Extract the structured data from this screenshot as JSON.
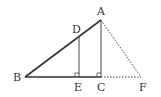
{
  "diagram": {
    "points": {
      "A": {
        "label": "A",
        "x": 101,
        "y": 20,
        "lx": 97,
        "ly": 15
      },
      "B": {
        "label": "B",
        "x": 25,
        "y": 77,
        "lx": 13,
        "ly": 81
      },
      "C": {
        "label": "C",
        "x": 101,
        "y": 77,
        "lx": 97,
        "ly": 91
      },
      "D": {
        "label": "D",
        "x": 79,
        "y": 37,
        "lx": 72,
        "ly": 33
      },
      "E": {
        "label": "E",
        "x": 79,
        "y": 77,
        "lx": 74,
        "ly": 91
      },
      "F": {
        "label": "F",
        "x": 141,
        "y": 77,
        "lx": 139,
        "ly": 91
      }
    },
    "solid_segments": [
      "AB",
      "BC",
      "AC",
      "DE"
    ],
    "dotted_segments": [
      "AF",
      "CF"
    ],
    "right_angles": [
      "E",
      "C"
    ],
    "colors": {
      "line": "#333333",
      "background": "#ffffff"
    }
  }
}
